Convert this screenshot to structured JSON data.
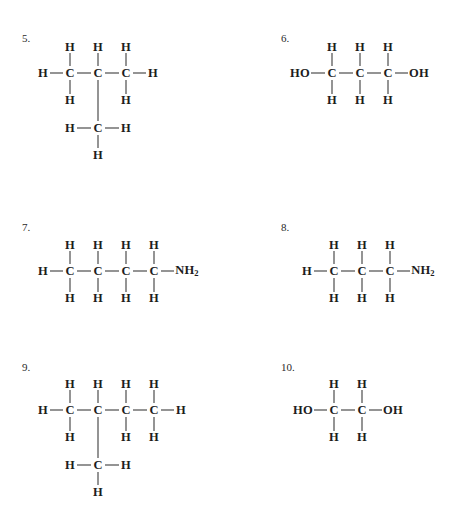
{
  "page": {
    "background": "#ffffff",
    "ink": "#1d1d1d",
    "bond_color": "#2b2b2b"
  },
  "problems": [
    {
      "id": "problem-5",
      "number": "5.",
      "number_pos": {
        "x": 22,
        "y": 33
      },
      "origin": {
        "x": 0,
        "y": 0
      },
      "name": "2-methylpropane",
      "atoms": [
        {
          "label": "H",
          "x": 70,
          "y": 47
        },
        {
          "label": "H",
          "x": 98,
          "y": 47
        },
        {
          "label": "H",
          "x": 126,
          "y": 47
        },
        {
          "label": "H",
          "x": 43,
          "y": 73
        },
        {
          "label": "C",
          "x": 70,
          "y": 73
        },
        {
          "label": "C",
          "x": 98,
          "y": 73
        },
        {
          "label": "C",
          "x": 126,
          "y": 73
        },
        {
          "label": "H",
          "x": 153,
          "y": 73
        },
        {
          "label": "H",
          "x": 70,
          "y": 100
        },
        {
          "label": "H",
          "x": 126,
          "y": 100
        },
        {
          "label": "H",
          "x": 70,
          "y": 128
        },
        {
          "label": "C",
          "x": 98,
          "y": 128
        },
        {
          "label": "H",
          "x": 126,
          "y": 128
        },
        {
          "label": "H",
          "x": 98,
          "y": 155
        }
      ],
      "bonds": [
        {
          "x1": 70,
          "y1": 53,
          "x2": 70,
          "y2": 66
        },
        {
          "x1": 98,
          "y1": 53,
          "x2": 98,
          "y2": 66
        },
        {
          "x1": 126,
          "y1": 53,
          "x2": 126,
          "y2": 66
        },
        {
          "x1": 50,
          "y1": 73,
          "x2": 63,
          "y2": 73
        },
        {
          "x1": 77,
          "y1": 73,
          "x2": 91,
          "y2": 73
        },
        {
          "x1": 105,
          "y1": 73,
          "x2": 119,
          "y2": 73
        },
        {
          "x1": 133,
          "y1": 73,
          "x2": 146,
          "y2": 73
        },
        {
          "x1": 70,
          "y1": 80,
          "x2": 70,
          "y2": 94
        },
        {
          "x1": 126,
          "y1": 80,
          "x2": 126,
          "y2": 94
        },
        {
          "x1": 98,
          "y1": 80,
          "x2": 98,
          "y2": 121
        },
        {
          "x1": 77,
          "y1": 128,
          "x2": 91,
          "y2": 128
        },
        {
          "x1": 105,
          "y1": 128,
          "x2": 119,
          "y2": 128
        },
        {
          "x1": 98,
          "y1": 135,
          "x2": 98,
          "y2": 148
        }
      ]
    },
    {
      "id": "problem-6",
      "number": "6.",
      "number_pos": {
        "x": 281,
        "y": 33
      },
      "origin": {
        "x": 0,
        "y": 0
      },
      "name": "1,3-propanediol",
      "atoms": [
        {
          "label": "H",
          "x": 332,
          "y": 47
        },
        {
          "label": "H",
          "x": 360,
          "y": 47
        },
        {
          "label": "H",
          "x": 388,
          "y": 47
        },
        {
          "label": "HO",
          "x": 300,
          "y": 73
        },
        {
          "label": "C",
          "x": 332,
          "y": 73
        },
        {
          "label": "C",
          "x": 360,
          "y": 73
        },
        {
          "label": "C",
          "x": 388,
          "y": 73
        },
        {
          "label": "OH",
          "x": 419,
          "y": 73
        },
        {
          "label": "H",
          "x": 332,
          "y": 100
        },
        {
          "label": "H",
          "x": 360,
          "y": 100
        },
        {
          "label": "H",
          "x": 388,
          "y": 100
        }
      ],
      "bonds": [
        {
          "x1": 332,
          "y1": 53,
          "x2": 332,
          "y2": 66
        },
        {
          "x1": 360,
          "y1": 53,
          "x2": 360,
          "y2": 66
        },
        {
          "x1": 388,
          "y1": 53,
          "x2": 388,
          "y2": 66
        },
        {
          "x1": 311,
          "y1": 73,
          "x2": 325,
          "y2": 73
        },
        {
          "x1": 339,
          "y1": 73,
          "x2": 353,
          "y2": 73
        },
        {
          "x1": 367,
          "y1": 73,
          "x2": 381,
          "y2": 73
        },
        {
          "x1": 395,
          "y1": 73,
          "x2": 408,
          "y2": 73
        },
        {
          "x1": 332,
          "y1": 80,
          "x2": 332,
          "y2": 94
        },
        {
          "x1": 360,
          "y1": 80,
          "x2": 360,
          "y2": 94
        },
        {
          "x1": 388,
          "y1": 80,
          "x2": 388,
          "y2": 94
        }
      ]
    },
    {
      "id": "problem-7",
      "number": "7.",
      "number_pos": {
        "x": 22,
        "y": 222
      },
      "origin": {
        "x": 0,
        "y": 0
      },
      "name": "1-butanamine",
      "atoms": [
        {
          "label": "H",
          "x": 70,
          "y": 245
        },
        {
          "label": "H",
          "x": 98,
          "y": 245
        },
        {
          "label": "H",
          "x": 126,
          "y": 245
        },
        {
          "label": "H",
          "x": 154,
          "y": 245
        },
        {
          "label": "H",
          "x": 43,
          "y": 271
        },
        {
          "label": "C",
          "x": 70,
          "y": 271
        },
        {
          "label": "C",
          "x": 98,
          "y": 271
        },
        {
          "label": "C",
          "x": 126,
          "y": 271
        },
        {
          "label": "C",
          "x": 154,
          "y": 271
        },
        {
          "label": "NH2",
          "x": 187,
          "y": 271,
          "sub": "2",
          "base": "NH"
        },
        {
          "label": "H",
          "x": 70,
          "y": 298
        },
        {
          "label": "H",
          "x": 98,
          "y": 298
        },
        {
          "label": "H",
          "x": 126,
          "y": 298
        },
        {
          "label": "H",
          "x": 154,
          "y": 298
        }
      ],
      "bonds": [
        {
          "x1": 70,
          "y1": 251,
          "x2": 70,
          "y2": 264
        },
        {
          "x1": 98,
          "y1": 251,
          "x2": 98,
          "y2": 264
        },
        {
          "x1": 126,
          "y1": 251,
          "x2": 126,
          "y2": 264
        },
        {
          "x1": 154,
          "y1": 251,
          "x2": 154,
          "y2": 264
        },
        {
          "x1": 50,
          "y1": 271,
          "x2": 63,
          "y2": 271
        },
        {
          "x1": 77,
          "y1": 271,
          "x2": 91,
          "y2": 271
        },
        {
          "x1": 105,
          "y1": 271,
          "x2": 119,
          "y2": 271
        },
        {
          "x1": 133,
          "y1": 271,
          "x2": 147,
          "y2": 271
        },
        {
          "x1": 161,
          "y1": 271,
          "x2": 174,
          "y2": 271
        },
        {
          "x1": 70,
          "y1": 278,
          "x2": 70,
          "y2": 292
        },
        {
          "x1": 98,
          "y1": 278,
          "x2": 98,
          "y2": 292
        },
        {
          "x1": 126,
          "y1": 278,
          "x2": 126,
          "y2": 292
        },
        {
          "x1": 154,
          "y1": 278,
          "x2": 154,
          "y2": 292
        }
      ]
    },
    {
      "id": "problem-8",
      "number": "8.",
      "number_pos": {
        "x": 281,
        "y": 222
      },
      "origin": {
        "x": 0,
        "y": 0
      },
      "name": "1-propanamine",
      "atoms": [
        {
          "label": "H",
          "x": 334,
          "y": 245
        },
        {
          "label": "H",
          "x": 362,
          "y": 245
        },
        {
          "label": "H",
          "x": 390,
          "y": 245
        },
        {
          "label": "H",
          "x": 307,
          "y": 271
        },
        {
          "label": "C",
          "x": 334,
          "y": 271
        },
        {
          "label": "C",
          "x": 362,
          "y": 271
        },
        {
          "label": "C",
          "x": 390,
          "y": 271
        },
        {
          "label": "NH2",
          "x": 423,
          "y": 271,
          "sub": "2",
          "base": "NH"
        },
        {
          "label": "H",
          "x": 334,
          "y": 298
        },
        {
          "label": "H",
          "x": 362,
          "y": 298
        },
        {
          "label": "H",
          "x": 390,
          "y": 298
        }
      ],
      "bonds": [
        {
          "x1": 334,
          "y1": 251,
          "x2": 334,
          "y2": 264
        },
        {
          "x1": 362,
          "y1": 251,
          "x2": 362,
          "y2": 264
        },
        {
          "x1": 390,
          "y1": 251,
          "x2": 390,
          "y2": 264
        },
        {
          "x1": 314,
          "y1": 271,
          "x2": 327,
          "y2": 271
        },
        {
          "x1": 341,
          "y1": 271,
          "x2": 355,
          "y2": 271
        },
        {
          "x1": 369,
          "y1": 271,
          "x2": 383,
          "y2": 271
        },
        {
          "x1": 397,
          "y1": 271,
          "x2": 410,
          "y2": 271
        },
        {
          "x1": 334,
          "y1": 278,
          "x2": 334,
          "y2": 292
        },
        {
          "x1": 362,
          "y1": 278,
          "x2": 362,
          "y2": 292
        },
        {
          "x1": 390,
          "y1": 278,
          "x2": 390,
          "y2": 292
        }
      ]
    },
    {
      "id": "problem-9",
      "number": "9.",
      "number_pos": {
        "x": 22,
        "y": 362
      },
      "origin": {
        "x": 0,
        "y": 0
      },
      "name": "2-methylbutane",
      "atoms": [
        {
          "label": "H",
          "x": 70,
          "y": 384
        },
        {
          "label": "H",
          "x": 98,
          "y": 384
        },
        {
          "label": "H",
          "x": 126,
          "y": 384
        },
        {
          "label": "H",
          "x": 154,
          "y": 384
        },
        {
          "label": "H",
          "x": 43,
          "y": 410
        },
        {
          "label": "C",
          "x": 70,
          "y": 410
        },
        {
          "label": "C",
          "x": 98,
          "y": 410
        },
        {
          "label": "C",
          "x": 126,
          "y": 410
        },
        {
          "label": "C",
          "x": 154,
          "y": 410
        },
        {
          "label": "H",
          "x": 181,
          "y": 410
        },
        {
          "label": "H",
          "x": 70,
          "y": 437
        },
        {
          "label": "H",
          "x": 126,
          "y": 437
        },
        {
          "label": "H",
          "x": 154,
          "y": 437
        },
        {
          "label": "H",
          "x": 70,
          "y": 465
        },
        {
          "label": "C",
          "x": 98,
          "y": 465
        },
        {
          "label": "H",
          "x": 126,
          "y": 465
        },
        {
          "label": "H",
          "x": 98,
          "y": 492
        }
      ],
      "bonds": [
        {
          "x1": 70,
          "y1": 390,
          "x2": 70,
          "y2": 403
        },
        {
          "x1": 98,
          "y1": 390,
          "x2": 98,
          "y2": 403
        },
        {
          "x1": 126,
          "y1": 390,
          "x2": 126,
          "y2": 403
        },
        {
          "x1": 154,
          "y1": 390,
          "x2": 154,
          "y2": 403
        },
        {
          "x1": 50,
          "y1": 410,
          "x2": 63,
          "y2": 410
        },
        {
          "x1": 77,
          "y1": 410,
          "x2": 91,
          "y2": 410
        },
        {
          "x1": 105,
          "y1": 410,
          "x2": 119,
          "y2": 410
        },
        {
          "x1": 133,
          "y1": 410,
          "x2": 147,
          "y2": 410
        },
        {
          "x1": 161,
          "y1": 410,
          "x2": 174,
          "y2": 410
        },
        {
          "x1": 70,
          "y1": 417,
          "x2": 70,
          "y2": 431
        },
        {
          "x1": 126,
          "y1": 417,
          "x2": 126,
          "y2": 431
        },
        {
          "x1": 154,
          "y1": 417,
          "x2": 154,
          "y2": 431
        },
        {
          "x1": 98,
          "y1": 417,
          "x2": 98,
          "y2": 458
        },
        {
          "x1": 77,
          "y1": 465,
          "x2": 91,
          "y2": 465
        },
        {
          "x1": 105,
          "y1": 465,
          "x2": 119,
          "y2": 465
        },
        {
          "x1": 98,
          "y1": 472,
          "x2": 98,
          "y2": 485
        }
      ]
    },
    {
      "id": "problem-10",
      "number": "10.",
      "number_pos": {
        "x": 281,
        "y": 362
      },
      "origin": {
        "x": 0,
        "y": 0
      },
      "name": "1,2-ethanediol",
      "atoms": [
        {
          "label": "H",
          "x": 334,
          "y": 384
        },
        {
          "label": "H",
          "x": 362,
          "y": 384
        },
        {
          "label": "HO",
          "x": 303,
          "y": 410
        },
        {
          "label": "C",
          "x": 334,
          "y": 410
        },
        {
          "label": "C",
          "x": 362,
          "y": 410
        },
        {
          "label": "OH",
          "x": 393,
          "y": 410
        },
        {
          "label": "H",
          "x": 334,
          "y": 437
        },
        {
          "label": "H",
          "x": 362,
          "y": 437
        }
      ],
      "bonds": [
        {
          "x1": 334,
          "y1": 390,
          "x2": 334,
          "y2": 403
        },
        {
          "x1": 362,
          "y1": 390,
          "x2": 362,
          "y2": 403
        },
        {
          "x1": 314,
          "y1": 410,
          "x2": 327,
          "y2": 410
        },
        {
          "x1": 341,
          "y1": 410,
          "x2": 355,
          "y2": 410
        },
        {
          "x1": 369,
          "y1": 410,
          "x2": 382,
          "y2": 410
        },
        {
          "x1": 334,
          "y1": 417,
          "x2": 334,
          "y2": 431
        },
        {
          "x1": 362,
          "y1": 417,
          "x2": 362,
          "y2": 431
        }
      ]
    }
  ]
}
